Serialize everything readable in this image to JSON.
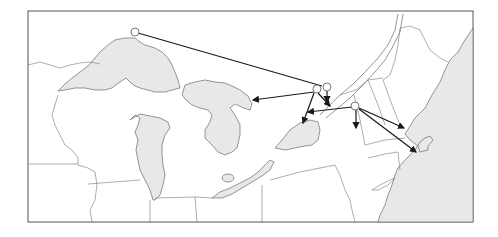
{
  "map": {
    "type": "flow-map",
    "region": "Great Lakes and Northeastern United States",
    "colors": {
      "water": "#e8e8e8",
      "land": "#ffffff",
      "border": "#777777",
      "arrow": "#1a1a1a",
      "frame": "#555555"
    },
    "origins": [
      {
        "id": "north-shore-superior",
        "x": 135,
        "y": 32
      },
      {
        "id": "st-lawrence-a",
        "x": 317,
        "y": 90
      },
      {
        "id": "st-lawrence-b",
        "x": 327,
        "y": 87
      },
      {
        "id": "central-new-york",
        "x": 356,
        "y": 106
      }
    ],
    "routes": [
      {
        "from": [
          135,
          32
        ],
        "to": [
          325,
          86
        ]
      },
      {
        "from": [
          317,
          90
        ],
        "to": [
          253,
          100
        ]
      },
      {
        "from": [
          317,
          90
        ],
        "to": [
          303,
          123
        ]
      },
      {
        "from": [
          320,
          92
        ],
        "to": [
          330,
          106
        ]
      },
      {
        "from": [
          327,
          89
        ],
        "to": [
          327,
          102
        ]
      },
      {
        "from": [
          354,
          107
        ],
        "to": [
          308,
          112
        ]
      },
      {
        "from": [
          356,
          108
        ],
        "to": [
          356,
          128
        ]
      },
      {
        "from": [
          358,
          108
        ],
        "to": [
          404,
          128
        ]
      },
      {
        "from": [
          358,
          108
        ],
        "to": [
          416,
          152
        ]
      }
    ]
  }
}
